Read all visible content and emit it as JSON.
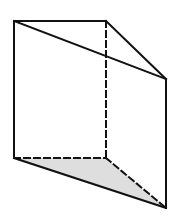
{
  "diagram": {
    "type": "triangular-prism",
    "colors": {
      "background": "#ffffff",
      "stroke": "#111111",
      "base_fill": "#dedede"
    },
    "vertices": {
      "top_front_left": [
        14,
        21
      ],
      "top_back": [
        106,
        21
      ],
      "top_front_right": [
        166,
        79
      ],
      "bottom_front_left": [
        14,
        158
      ],
      "bottom_back": [
        106,
        158
      ],
      "bottom_front_right": [
        166,
        208
      ]
    },
    "edges": {
      "solid": [
        [
          "top_front_left",
          "top_back"
        ],
        [
          "top_back",
          "top_front_right"
        ],
        [
          "top_front_left",
          "top_front_right"
        ],
        [
          "top_front_left",
          "bottom_front_left"
        ],
        [
          "top_front_right",
          "bottom_front_right"
        ],
        [
          "bottom_front_left",
          "bottom_front_right"
        ]
      ],
      "hidden_dashed": [
        [
          "top_back",
          "bottom_back"
        ],
        [
          "bottom_front_left",
          "bottom_back"
        ],
        [
          "bottom_back",
          "bottom_front_right"
        ]
      ]
    },
    "shaded_face": [
      "bottom_front_left",
      "bottom_back",
      "bottom_front_right"
    ]
  }
}
